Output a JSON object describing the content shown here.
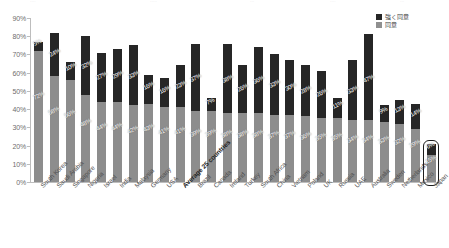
{
  "ghost_top_row": {
    "fragments": [
      "",
      "",
      "",
      "",
      ""
    ]
  },
  "legend": {
    "position": "top-right",
    "items": [
      {
        "label": "強く同意",
        "color": "#262626",
        "name": "strongly-agree"
      },
      {
        "label": "同意",
        "color": "#8d8d8d",
        "name": "agree"
      }
    ]
  },
  "axis": {
    "y_ticks": [
      "0%",
      "10%",
      "20%",
      "30%",
      "40%",
      "50%",
      "60%",
      "70%",
      "80%",
      "90%"
    ],
    "y_min": 0,
    "y_max": 90
  },
  "highlight": {
    "country": "Japan",
    "style": "rounded-rect-outline",
    "color": "#1d1d1d"
  },
  "chart_data": {
    "type": "bar",
    "stacked": true,
    "title": "",
    "subtitle": "",
    "xlabel": "",
    "ylabel": "",
    "ylim": [
      0,
      90
    ],
    "ytick_step": 10,
    "grid": false,
    "legend_position": "top-right",
    "categories": [
      "South Korea",
      "Saudi Arabia",
      "Singapore",
      "Nigeria",
      "Israel",
      "India",
      "Malaysia",
      "Germany",
      "USA",
      "Average 25 countries",
      "Brazil",
      "Canada",
      "Ireland",
      "Turkey",
      "South Africa",
      "China",
      "Vietnam",
      "Poland",
      "UK",
      "Russia",
      "UAE",
      "Australia",
      "Sweden",
      "Netherlands",
      "Mexico",
      "Japan"
    ],
    "highlighted_category": "Japan",
    "bold_category": "Average 25 countries",
    "series": [
      {
        "name": "同意",
        "color": "#8d8d8d",
        "values": [
          72,
          58,
          56,
          48,
          44,
          44,
          42,
          43,
          41,
          41,
          39,
          39,
          38,
          38,
          38,
          37,
          37,
          36,
          35,
          35,
          34,
          34,
          33,
          32,
          29,
          15
        ]
      },
      {
        "name": "強く同意",
        "color": "#262626",
        "values": [
          5,
          24,
          10,
          32,
          27,
          29,
          33,
          16,
          16,
          23,
          37,
          7,
          38,
          26,
          36,
          33,
          30,
          28,
          26,
          11,
          33,
          47,
          9,
          13,
          14,
          6
        ]
      }
    ],
    "totals": [
      77,
      82,
      66,
      80,
      71,
      73,
      75,
      59,
      57,
      64,
      76,
      46,
      76,
      64,
      74,
      70,
      67,
      64,
      61,
      46,
      67,
      81,
      42,
      45,
      43,
      21
    ]
  }
}
